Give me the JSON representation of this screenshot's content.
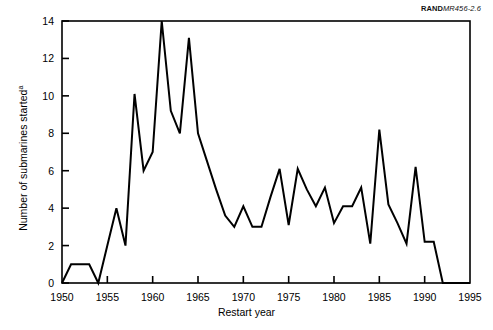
{
  "figure": {
    "source_label_bold": "RAND",
    "source_label_italic": "MR456-2.6",
    "source_label_full": "RANDMR456-2.6"
  },
  "chart_data": {
    "type": "line",
    "title": "",
    "xlabel": "Restart year",
    "ylabel": "Number of submarines started",
    "ylabel_superscript": "a",
    "xlim": [
      1950,
      1995
    ],
    "ylim": [
      0,
      14
    ],
    "xticks": [
      1950,
      1955,
      1960,
      1965,
      1970,
      1975,
      1980,
      1985,
      1990,
      1995
    ],
    "xtick_labels": [
      "1950",
      "1955",
      "1960",
      "1965",
      "1970",
      "1975",
      "1980",
      "1985",
      "1990",
      "1995"
    ],
    "yticks": [
      0,
      2,
      4,
      6,
      8,
      10,
      12,
      14
    ],
    "ytick_labels": [
      "0",
      "2",
      "4",
      "6",
      "8",
      "10",
      "12",
      "14"
    ],
    "grid": false,
    "legend": null,
    "line_color": "#000000",
    "line_width": 2,
    "x": [
      1950,
      1951,
      1952,
      1953,
      1954,
      1955,
      1956,
      1957,
      1958,
      1959,
      1960,
      1961,
      1962,
      1963,
      1964,
      1965,
      1966,
      1967,
      1968,
      1969,
      1970,
      1971,
      1972,
      1973,
      1974,
      1975,
      1976,
      1977,
      1978,
      1979,
      1980,
      1981,
      1982,
      1983,
      1984,
      1985,
      1986,
      1987,
      1988,
      1989,
      1990,
      1991,
      1992,
      1993,
      1994,
      1995
    ],
    "values": [
      0,
      1,
      1,
      1,
      0,
      2,
      4,
      2,
      10.1,
      6,
      7,
      14,
      9.2,
      8,
      13.1,
      8,
      6.5,
      5,
      3.6,
      3,
      4.1,
      3,
      3,
      4.6,
      6.1,
      3.1,
      6.1,
      5,
      4.1,
      5.1,
      3.2,
      4.1,
      4.1,
      5.1,
      2.1,
      8.2,
      4.2,
      3.2,
      2.1,
      6.2,
      2.2,
      2.2,
      0,
      0,
      0,
      0
    ]
  }
}
